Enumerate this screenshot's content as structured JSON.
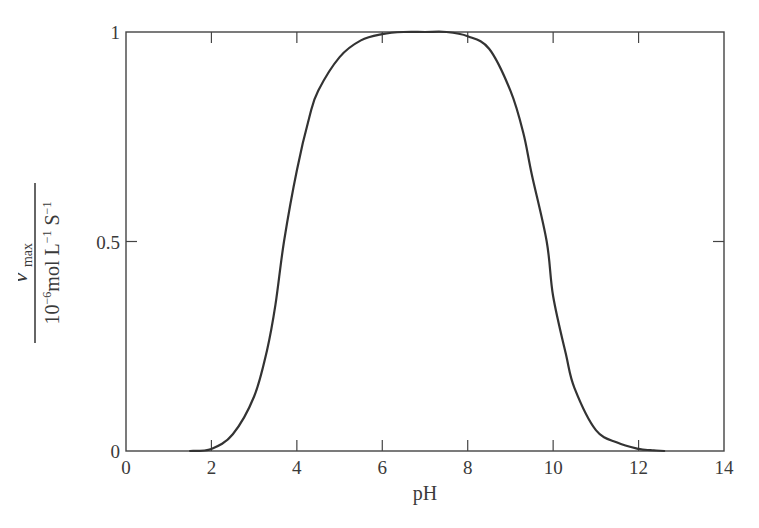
{
  "chart_data": {
    "type": "line",
    "title": "",
    "xlabel": "pH",
    "ylabel": {
      "numerator": "v′max",
      "numerator_main": "v′",
      "numerator_sub": "max",
      "denominator": "10⁻⁶ mol L⁻¹ S⁻¹",
      "denominator_parts": [
        "10",
        "−6",
        "mol L",
        "−1",
        " S",
        "−1"
      ]
    },
    "xlim": [
      0,
      14
    ],
    "ylim": [
      0,
      1
    ],
    "xticks": [
      0,
      2,
      4,
      6,
      8,
      10,
      12,
      14
    ],
    "xtick_labels": [
      "0",
      "2",
      "4",
      "6",
      "8",
      "10",
      "12",
      "14"
    ],
    "yticks": [
      0,
      0.5,
      1
    ],
    "ytick_labels": [
      "0",
      "0.5",
      "1"
    ],
    "grid": false,
    "legend": null,
    "series": [
      {
        "name": "v′max vs pH",
        "color": "#333333",
        "x": [
          1.5,
          2.0,
          2.5,
          3.0,
          3.3,
          3.5,
          3.7,
          4.0,
          4.3,
          4.5,
          5.0,
          5.5,
          6.0,
          6.5,
          7.0,
          7.5,
          8.0,
          8.5,
          9.0,
          9.3,
          9.5,
          9.85,
          10.0,
          10.3,
          10.5,
          11.0,
          11.5,
          12.0,
          12.3,
          12.6
        ],
        "values": [
          0.0,
          0.005,
          0.04,
          0.13,
          0.24,
          0.35,
          0.5,
          0.67,
          0.8,
          0.86,
          0.94,
          0.98,
          0.995,
          1.0,
          1.0,
          1.0,
          0.99,
          0.96,
          0.86,
          0.76,
          0.66,
          0.5,
          0.37,
          0.23,
          0.15,
          0.05,
          0.02,
          0.005,
          0.002,
          0.0
        ]
      }
    ]
  }
}
